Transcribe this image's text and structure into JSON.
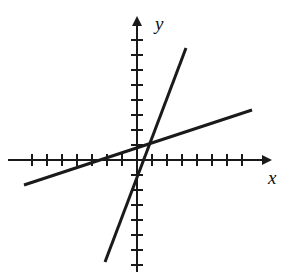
{
  "figure": {
    "type": "coordinate-plane-graph",
    "width": 291,
    "height": 274,
    "background_color": "#ffffff",
    "ink_color": "#1a1a1a"
  },
  "axes": {
    "x_label": "x",
    "y_label": "y",
    "x_label_position": {
      "x": 268,
      "y": 184
    },
    "y_label_position": {
      "x": 155,
      "y": 30
    },
    "origin_px": {
      "x": 137,
      "y": 160
    },
    "unit_px": 15,
    "x_axis": {
      "start_px": {
        "x": 8,
        "y": 160
      },
      "end_px": {
        "x": 262,
        "y": 160
      },
      "arrow": "right",
      "tick_count_negative": 7,
      "tick_count_positive": 7,
      "tick_half_length_px": 6
    },
    "y_axis": {
      "start_px": {
        "x": 137,
        "y": 272
      },
      "end_px": {
        "x": 137,
        "y": 26
      },
      "arrow": "up",
      "tick_count_positive": 8,
      "tick_count_negative": 7,
      "tick_half_length_px": 6
    },
    "grid": false,
    "tick_labels": []
  },
  "chart_data": {
    "type": "line",
    "title": "",
    "xlabel": "x",
    "ylabel": "y",
    "xlim": [
      -8.6,
      8.3
    ],
    "ylim": [
      -7.5,
      9.0
    ],
    "grid": false,
    "legend": "none",
    "axis_arrows": [
      "x-positive",
      "y-positive"
    ],
    "tick_spacing": 1,
    "series": [
      {
        "name": "steep-line",
        "slope": 4.0,
        "intercept": -2.5,
        "equation": "y = 4x - 2.5",
        "x": [
          -2.15,
          3.25
        ],
        "values": [
          -11.1,
          10.5
        ],
        "endpoints_px": [
          {
            "x": 105,
            "y": 262
          },
          {
            "x": 186,
            "y": 48
          }
        ],
        "stroke_width": 3
      },
      {
        "name": "shallow-line",
        "slope": 0.33,
        "intercept": 1.2,
        "equation": "y = 0.33x + 1.2",
        "x": [
          -7.55,
          7.65
        ],
        "values": [
          -1.3,
          3.7
        ],
        "endpoints_px": [
          {
            "x": 24,
            "y": 185
          },
          {
            "x": 252,
            "y": 110
          }
        ],
        "stroke_width": 3
      }
    ],
    "intersection": {
      "x": 1.0,
      "y": 1.5,
      "px": {
        "x": 152,
        "y": 138
      }
    }
  }
}
